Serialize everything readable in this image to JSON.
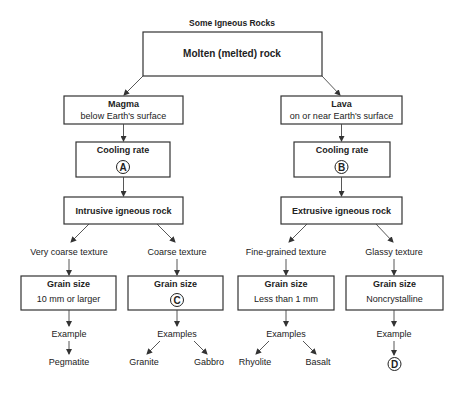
{
  "diagram": {
    "title": "Some Igneous Rocks",
    "root": "Molten (melted) rock",
    "left": {
      "source_title": "Magma",
      "source_sub": "below Earth's surface",
      "cooling_label": "Cooling rate",
      "cooling_marker": "A",
      "rock_type": "Intrusive igneous rock",
      "branches": [
        {
          "texture": "Very coarse texture",
          "grain_label": "Grain size",
          "grain_value": "10 mm or larger",
          "example_label": "Example",
          "examples": [
            "Pegmatite"
          ]
        },
        {
          "texture": "Coarse texture",
          "grain_label": "Grain size",
          "grain_marker": "C",
          "example_label": "Examples",
          "examples": [
            "Granite",
            "Gabbro"
          ]
        }
      ]
    },
    "right": {
      "source_title": "Lava",
      "source_sub": "on or near Earth's surface",
      "cooling_label": "Cooling rate",
      "cooling_marker": "B",
      "rock_type": "Extrusive igneous rock",
      "branches": [
        {
          "texture": "Fine-grained texture",
          "grain_label": "Grain size",
          "grain_value": "Less than 1 mm",
          "example_label": "Examples",
          "examples": [
            "Rhyolite",
            "Basalt"
          ]
        },
        {
          "texture": "Glassy texture",
          "grain_label": "Grain size",
          "grain_value": "Noncrystalline",
          "example_label": "Example",
          "example_marker": "D"
        }
      ]
    }
  }
}
